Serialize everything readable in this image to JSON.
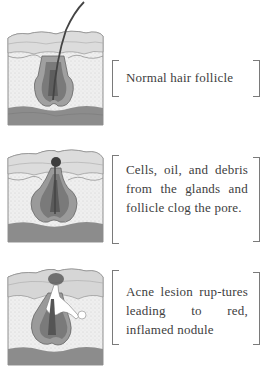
{
  "diagram": {
    "topic": "Stages of acne formation in a hair follicle",
    "stages": [
      {
        "id": "normal",
        "caption": "Normal hair follicle",
        "illustration": "skin-cross-section-normal-follicle-icon"
      },
      {
        "id": "clogged",
        "caption": "Cells, oil, and debris from the glands and follicle clog the pore.",
        "illustration": "skin-cross-section-clogged-pore-icon"
      },
      {
        "id": "ruptured",
        "caption": "Acne lesion ruptures leading to red, inflamed nodule",
        "caption_display": "Acne lesion rup-tures leading to red, inflamed nodule",
        "illustration": "skin-cross-section-ruptured-lesion-icon"
      }
    ],
    "colors": {
      "epidermis": "#d8d8d8",
      "dermis": "#ececec",
      "subcutis": "#8a8a8a",
      "follicle": "#9a9a9a",
      "follicle_inner": "#6c6c6c",
      "bracket": "#7a7a7a",
      "text": "#404040"
    }
  }
}
